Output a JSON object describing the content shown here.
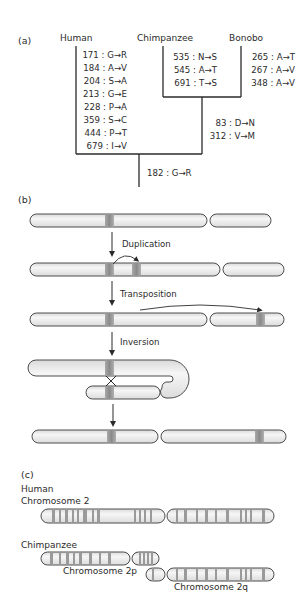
{
  "figure": {
    "panel_a": {
      "label": "(a)",
      "species": {
        "human": "Human",
        "chimpanzee": "Chimpanzee",
        "bonobo": "Bonobo"
      },
      "human_mutations": [
        "171 : G→R",
        "184 : A→V",
        "204 : S→A",
        "213 : G→E",
        "228 : P→A",
        "359 : S→C",
        "444 : P→T",
        "679 : I→V"
      ],
      "chimpanzee_mutations": [
        "535 : N→S",
        "545 : A→T",
        "691 : T→S"
      ],
      "bonobo_mutations": [
        "265 : A→T",
        "267 : A→V",
        "348 : A→V"
      ],
      "pan_ancestor_mutations": [
        "83 : D→N",
        "312 : V→M"
      ],
      "root_mutations": [
        "182 : G→R"
      ]
    },
    "panel_b": {
      "label": "(b)",
      "steps": [
        "Duplication",
        "Transposition",
        "Inversion"
      ]
    },
    "panel_c": {
      "label": "(c)",
      "human_label_line1": "Human",
      "human_label_line2": "Chromosome 2",
      "chimp_label": "Chimpanzee",
      "chr2p_label": "Chromosome 2p",
      "chr2q_label": "Chromosome 2q"
    },
    "colors": {
      "line": "#2b2b2b",
      "chromosome_fill": "#e9e9e9",
      "band": "#8e8e8e",
      "band_light": "#b5b5b5"
    }
  }
}
